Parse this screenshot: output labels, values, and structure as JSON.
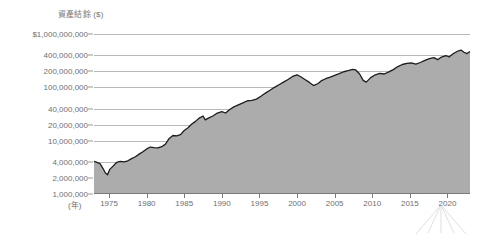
{
  "chart_data": {
    "type": "area",
    "title": "資產結餘 ($)",
    "xlabel": "(年)",
    "ylabel": "資產結餘 ($)",
    "yscale": "log",
    "ylim": [
      1000000,
      1000000000
    ],
    "xlim": [
      1973,
      2023
    ],
    "grid": true,
    "legend": false,
    "fill_color": "#acacac",
    "line_color": "#1c1c1c",
    "grid_color": "#b9b9b9",
    "background_color": "#ffffff",
    "ytick_labels": [
      "$1,000,000,000",
      "400,000,000",
      "200,000,000",
      "100,000,000",
      "40,000,000",
      "20,000,000",
      "10,000,000",
      "4,000,000",
      "2,000,000",
      "1,000,000"
    ],
    "ytick_values": [
      1000000000,
      400000000,
      200000000,
      100000000,
      40000000,
      20000000,
      10000000,
      4000000,
      2000000,
      1000000
    ],
    "xtick_labels": [
      "1975",
      "1980",
      "1985",
      "1990",
      "1995",
      "2000",
      "2005",
      "2010",
      "2015",
      "2020"
    ],
    "xtick_values": [
      1975,
      1980,
      1985,
      1990,
      1995,
      2000,
      2005,
      2010,
      2015,
      2020
    ],
    "x": [
      1973.0,
      1973.4,
      1973.8,
      1974.2,
      1974.5,
      1974.8,
      1975.1,
      1975.5,
      1976.0,
      1976.5,
      1977.0,
      1977.5,
      1978.0,
      1978.5,
      1979.0,
      1979.5,
      1980.0,
      1980.5,
      1981.0,
      1981.5,
      1982.0,
      1982.5,
      1983.0,
      1983.5,
      1984.0,
      1984.5,
      1985.0,
      1985.5,
      1986.0,
      1986.5,
      1987.0,
      1987.5,
      1987.8,
      1988.2,
      1988.8,
      1989.4,
      1990.0,
      1990.5,
      1991.0,
      1991.6,
      1992.2,
      1992.8,
      1993.4,
      1994.0,
      1994.6,
      1995.2,
      1995.8,
      1996.4,
      1997.0,
      1997.6,
      1998.2,
      1998.8,
      1999.4,
      2000.0,
      2000.5,
      2001.0,
      2001.6,
      2002.2,
      2002.8,
      2003.2,
      2003.8,
      2004.4,
      2005.0,
      2005.6,
      2006.2,
      2006.8,
      2007.4,
      2007.8,
      2008.3,
      2008.8,
      2009.2,
      2009.8,
      2010.4,
      2011.0,
      2011.6,
      2012.2,
      2012.8,
      2013.4,
      2014.0,
      2014.6,
      2015.2,
      2015.8,
      2016.4,
      2017.0,
      2017.6,
      2018.2,
      2018.7,
      2019.2,
      2019.8,
      2020.2,
      2020.8,
      2021.4,
      2021.8,
      2022.2,
      2022.6,
      2023.0
    ],
    "y": [
      4100000,
      3900000,
      3700000,
      3000000,
      2500000,
      2300000,
      2900000,
      3300000,
      3900000,
      4100000,
      4000000,
      4200000,
      4600000,
      5000000,
      5600000,
      6200000,
      7000000,
      7600000,
      7400000,
      7300000,
      7700000,
      8600000,
      11000000,
      12500000,
      12300000,
      13000000,
      15500000,
      17500000,
      20500000,
      23000000,
      26500000,
      29000000,
      24500000,
      26500000,
      29000000,
      33000000,
      35000000,
      33000000,
      38000000,
      43000000,
      47000000,
      51000000,
      56000000,
      57000000,
      60000000,
      68000000,
      78000000,
      88000000,
      100000000,
      112000000,
      125000000,
      140000000,
      160000000,
      172000000,
      158000000,
      142000000,
      125000000,
      108000000,
      118000000,
      132000000,
      145000000,
      155000000,
      168000000,
      180000000,
      196000000,
      205000000,
      218000000,
      212000000,
      180000000,
      135000000,
      125000000,
      152000000,
      172000000,
      182000000,
      178000000,
      195000000,
      215000000,
      245000000,
      268000000,
      282000000,
      286000000,
      272000000,
      292000000,
      320000000,
      345000000,
      360000000,
      330000000,
      370000000,
      395000000,
      370000000,
      430000000,
      480000000,
      500000000,
      455000000,
      430000000,
      470000000
    ]
  },
  "annotations": {
    "watermark": "watermark-mark"
  }
}
